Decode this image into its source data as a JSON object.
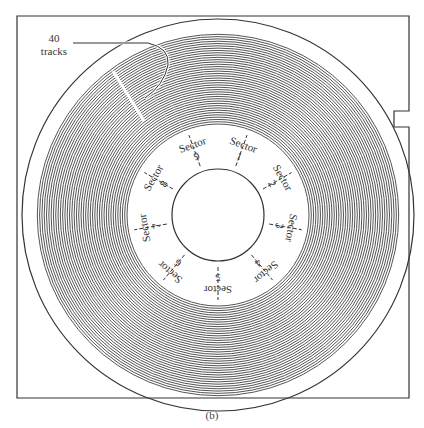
{
  "figure": {
    "annotation": {
      "line1": "40",
      "line2": "tracks"
    },
    "track_count": 40,
    "sectors": [
      {
        "word": "Sector",
        "num": "1"
      },
      {
        "word": "Sector",
        "num": "2"
      },
      {
        "word": "Sector",
        "num": "3"
      },
      {
        "word": "Sector",
        "num": "4"
      },
      {
        "word": "Sector",
        "num": "5"
      },
      {
        "word": "Sector",
        "num": "6"
      },
      {
        "word": "Sector",
        "num": "7"
      },
      {
        "word": "Sector",
        "num": "8"
      },
      {
        "word": "Sector",
        "num": "9"
      }
    ],
    "caption": "(b)",
    "colors": {
      "line": "#333333",
      "track": "#555555",
      "background": "#ffffff"
    }
  }
}
